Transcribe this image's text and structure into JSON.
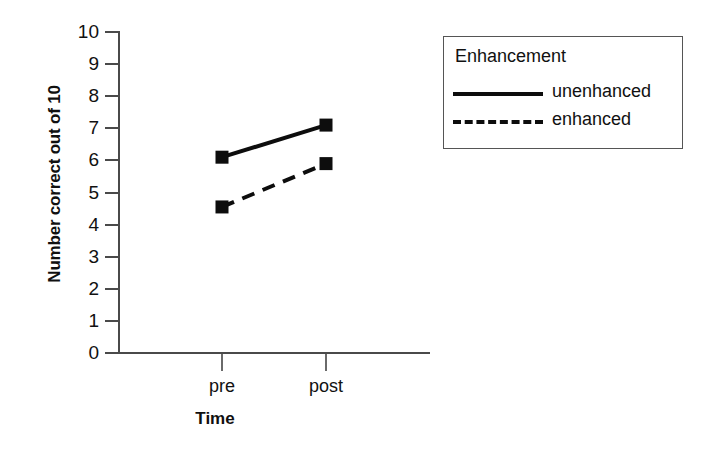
{
  "chart_data": {
    "type": "line",
    "title": "",
    "xlabel": "Time",
    "ylabel": "Number correct out of 10",
    "categories": [
      "pre",
      "post"
    ],
    "x": [
      0,
      1
    ],
    "ylim": [
      0,
      10
    ],
    "ytick_labels": [
      "10",
      "9",
      "8",
      "7",
      "6",
      "5",
      "4",
      "3",
      "2",
      "1",
      "0"
    ],
    "ytick_values": [
      10,
      9,
      8,
      7,
      6,
      5,
      4,
      3,
      2,
      1,
      0
    ],
    "grid": false,
    "legend_position": "right",
    "legend_title": "Enhancement",
    "marker": "square",
    "marker_color": "#0d0d0d",
    "series": [
      {
        "name": "unenhanced",
        "values": [
          6.1,
          7.1
        ],
        "linestyle": "solid",
        "color": "#0d0d0d"
      },
      {
        "name": "enhanced",
        "values": [
          4.55,
          5.9
        ],
        "linestyle": "dashed",
        "color": "#0d0d0d"
      }
    ]
  },
  "axis": {
    "x_label": "Time",
    "y_label": "Number correct out of 10"
  },
  "legend": {
    "title": "Enhancement",
    "entries": [
      {
        "label": "unenhanced",
        "style": "solid"
      },
      {
        "label": "enhanced",
        "style": "dashed"
      }
    ]
  }
}
